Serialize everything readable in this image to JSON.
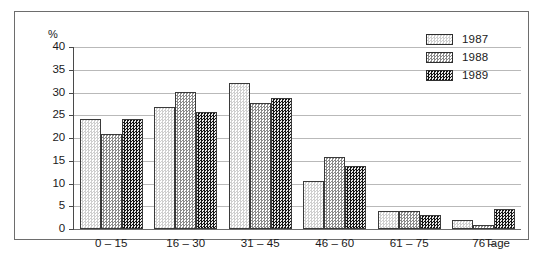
{
  "chart_data": {
    "type": "bar",
    "title": "",
    "subtitle": "",
    "xlabel": "Tage",
    "ylabel": "%",
    "categories": [
      "0 – 15",
      "16 – 30",
      "31 – 45",
      "46 – 60",
      "61 – 75",
      "76 –"
    ],
    "series": [
      {
        "name": "1987",
        "values": [
          24.1,
          26.9,
          32.0,
          10.6,
          3.9,
          2.0
        ]
      },
      {
        "name": "1988",
        "values": [
          20.8,
          30.1,
          27.7,
          15.9,
          3.9,
          0.8
        ]
      },
      {
        "name": "1989",
        "values": [
          24.1,
          25.7,
          28.9,
          13.9,
          3.1,
          4.4
        ]
      }
    ],
    "ylim": [
      0,
      40
    ],
    "yticks": [
      0,
      5,
      10,
      15,
      20,
      25,
      30,
      35,
      40
    ],
    "ytick_labels": [
      "0",
      "5",
      "10",
      "15",
      "20",
      "25",
      "30",
      "35",
      "40"
    ],
    "grid": "horizontal",
    "legend_position": "top-right",
    "series_colors": [
      "#cfcfcf",
      "#8a8a8a",
      "#141414"
    ]
  },
  "axis": {
    "unit_label": "%",
    "x_unit_label": "Tage"
  },
  "legend": {
    "entries": [
      {
        "label": "1987"
      },
      {
        "label": "1988"
      },
      {
        "label": "1989"
      }
    ]
  }
}
